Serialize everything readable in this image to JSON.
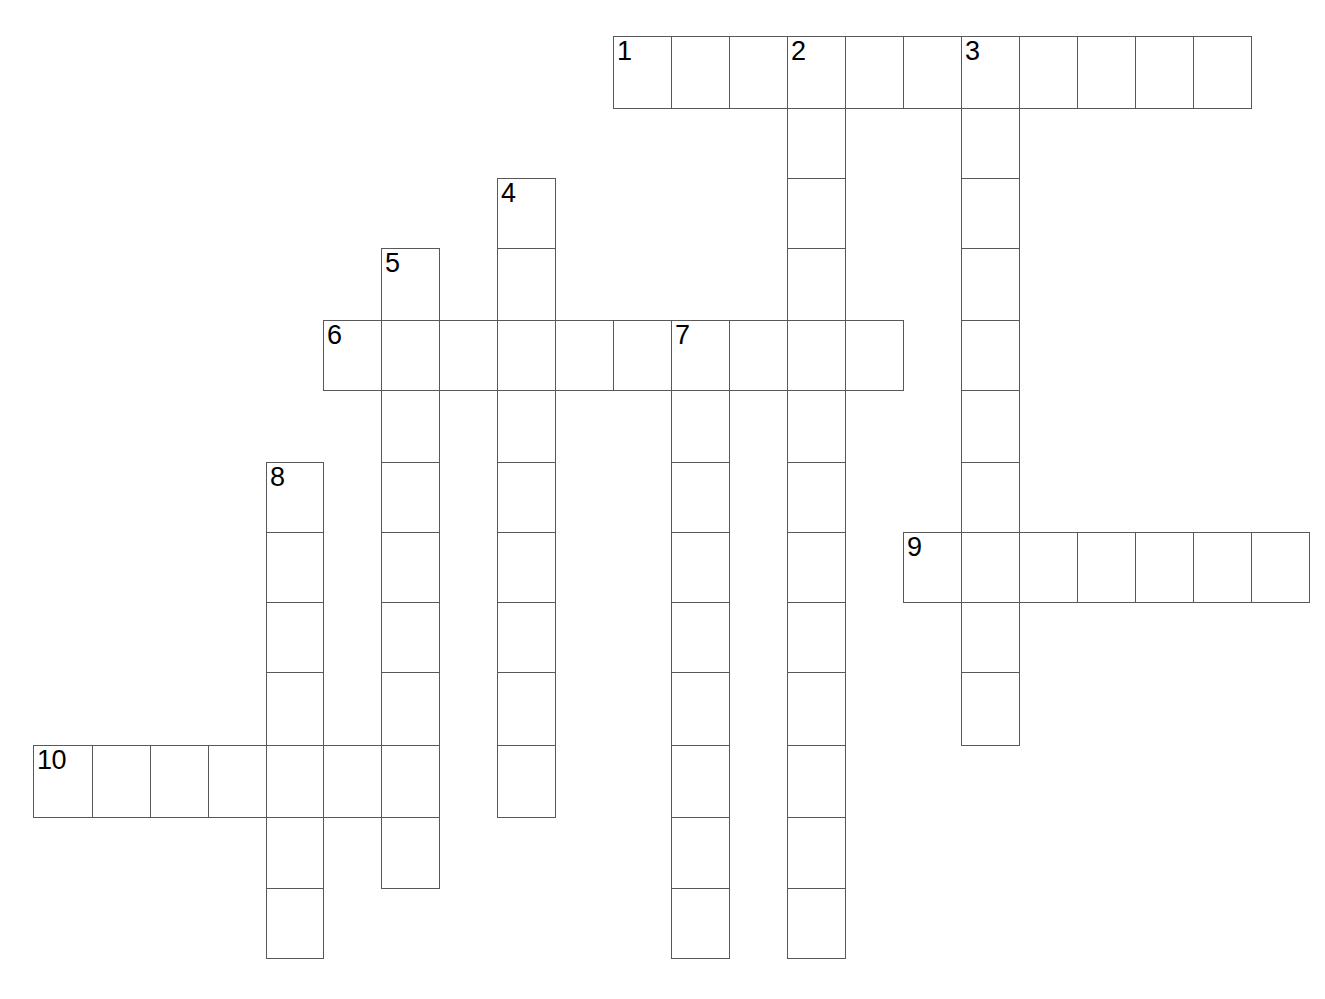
{
  "puzzle": {
    "title": "Crossword Puzzle Grid",
    "background_color": "#ffffff",
    "cell_border_color": "#58585a",
    "cell_fill_color": "#ffffff",
    "number_color": "#000000",
    "cell_size": 58,
    "cell_height": 71,
    "grid_origin_x": 33,
    "grid_origin_y": 36,
    "total_clues": 10,
    "across_count": 4,
    "down_count": 6
  },
  "entries": [
    {
      "number": "1",
      "direction": "across",
      "col": 10,
      "row": 0,
      "length": 11
    },
    {
      "number": "2",
      "direction": "down",
      "col": 13,
      "row": 0,
      "length": 13
    },
    {
      "number": "3",
      "direction": "down",
      "col": 16,
      "row": 0,
      "length": 10
    },
    {
      "number": "4",
      "direction": "down",
      "col": 8,
      "row": 2,
      "length": 9
    },
    {
      "number": "5",
      "direction": "down",
      "col": 6,
      "row": 3,
      "length": 9
    },
    {
      "number": "6",
      "direction": "across",
      "col": 5,
      "row": 4,
      "length": 10
    },
    {
      "number": "7",
      "direction": "down",
      "col": 11,
      "row": 4,
      "length": 9
    },
    {
      "number": "8",
      "direction": "down",
      "col": 4,
      "row": 6,
      "length": 7
    },
    {
      "number": "9",
      "direction": "across",
      "col": 15,
      "row": 7,
      "length": 7
    },
    {
      "number": "10",
      "direction": "across",
      "col": 0,
      "row": 10,
      "length": 7
    }
  ],
  "numbered_cells": [
    {
      "label": "1",
      "col": 10,
      "row": 0
    },
    {
      "label": "2",
      "col": 13,
      "row": 0
    },
    {
      "label": "3",
      "col": 16,
      "row": 0
    },
    {
      "label": "4",
      "col": 8,
      "row": 2
    },
    {
      "label": "5",
      "col": 6,
      "row": 3
    },
    {
      "label": "6",
      "col": 5,
      "row": 4
    },
    {
      "label": "7",
      "col": 11,
      "row": 4
    },
    {
      "label": "8",
      "col": 4,
      "row": 6
    },
    {
      "label": "9",
      "col": 15,
      "row": 7
    },
    {
      "label": "10",
      "col": 0,
      "row": 10
    }
  ],
  "column_x": [
    33,
    92,
    150,
    208,
    266,
    323,
    381,
    439,
    497,
    555,
    613,
    671,
    729,
    787,
    845,
    903,
    961,
    1019,
    1077,
    1135,
    1193,
    1251
  ],
  "row_y": [
    36,
    108,
    178,
    248,
    320,
    390,
    462,
    532,
    602,
    672,
    745,
    817,
    888,
    958,
    1028
  ]
}
